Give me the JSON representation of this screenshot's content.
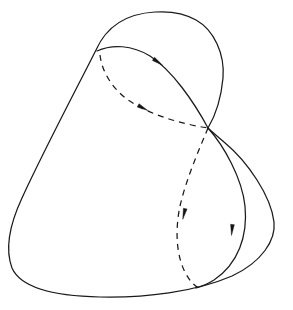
{
  "figure": {
    "width": 293,
    "height": 310,
    "background_color": "#ffffff",
    "ink_color": "#1a1a1a",
    "arrow_color": "#141414",
    "stroke_width": 1.25,
    "dash_pattern": "6 5",
    "node_point": {
      "x": 208,
      "y": 128,
      "label": "self-intersection node"
    },
    "strokes": [
      {
        "id": "outer-boundary",
        "name": "outer-closed-curve",
        "style": "solid",
        "description": "Large rounded triangular closed loop forming the outer boundary",
        "path": "M 155 12 C 120 14 104 32 96 50 C 80 82 44 150 22 198 C 8 228 6 252 12 268 C 20 286 50 296 100 297 C 145 298 195 292 232 276 C 262 262 276 240 274 222 C 271 196 248 162 224 142 C 216 135 211 131 208 128 C 214 118 221 100 223 78 C 225 54 214 30 196 20 C 184 13 170 11 155 12 Z"
      },
      {
        "id": "inner-arc-left",
        "name": "inner-arc-from-apex-to-node",
        "style": "solid",
        "description": "Inner solid arc from upper-left junction over a low apex down to the node",
        "path": "M 97 51 C 112 44 132 45 150 56 C 172 70 194 102 208 128"
      },
      {
        "id": "inner-arc-right",
        "name": "inner-lobe-right",
        "style": "solid",
        "description": "Solid lobe from the node curving down and right to the lower boundary",
        "path": "M 208 128 C 224 146 242 178 245 206 C 248 236 238 264 214 280 C 206 285 200 287 196 288"
      },
      {
        "id": "dashed-upper",
        "name": "dashed-arc-upper",
        "style": "dashed",
        "description": "Dashed arc leaving the upper-left junction, sweeping right to the node",
        "path": "M 100 55 C 102 72 112 88 128 100 C 150 115 182 124 208 128"
      },
      {
        "id": "dashed-lower",
        "name": "dashed-loop-lower",
        "style": "dashed",
        "description": "Dashed loop descending from the node, bulging left, closing at the bottom",
        "path": "M 208 128 C 198 152 186 180 180 206 C 175 230 176 256 186 274 C 191 283 196 287 201 289"
      }
    ],
    "arrows": [
      {
        "id": "arrow-1",
        "name": "direction-arrow-inner-upper",
        "x": 158,
        "y": 62,
        "angle": 35,
        "on_stroke": "inner-arc-left"
      },
      {
        "id": "arrow-2",
        "name": "direction-arrow-dashed-upper",
        "x": 143,
        "y": 108,
        "angle": 28,
        "on_stroke": "dashed-upper"
      },
      {
        "id": "arrow-3",
        "name": "direction-arrow-dashed-lower",
        "x": 184,
        "y": 214,
        "angle": 103,
        "on_stroke": "dashed-lower"
      },
      {
        "id": "arrow-4",
        "name": "direction-arrow-inner-right",
        "x": 232,
        "y": 230,
        "angle": 95,
        "on_stroke": "inner-arc-right"
      }
    ]
  }
}
